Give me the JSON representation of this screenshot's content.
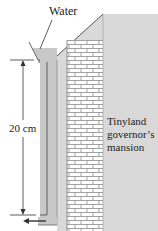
{
  "labels": {
    "water": "Water",
    "height": "20 cm",
    "building_line1": "Tinyland",
    "building_line2": "governor’s",
    "building_line3": "mansion"
  },
  "colors": {
    "water_fill": "#c8c8c8",
    "wall_fill": "#ffffff",
    "brick_line": "#8a8a8a",
    "roof_fill": "#d4d4d4",
    "outline": "#555555",
    "arrow": "#333333"
  },
  "dimensions": {
    "height_value": 20,
    "height_unit": "cm"
  }
}
